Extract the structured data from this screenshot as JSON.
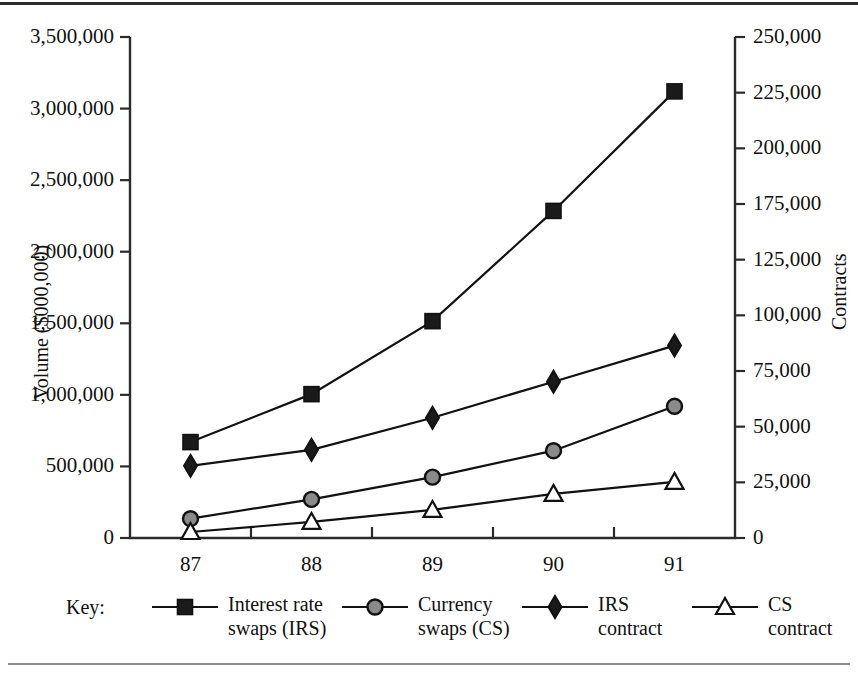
{
  "chart_data": {
    "type": "line",
    "title": "",
    "subtitle": "",
    "xlabel": "",
    "ylabel": "Volume ($000,000)",
    "y2label": "Contracts",
    "x": [
      "87",
      "88",
      "89",
      "90",
      "91"
    ],
    "categories": [
      "87",
      "88",
      "89",
      "90",
      "91"
    ],
    "ylim": [
      0,
      3500000
    ],
    "y2lim": [
      0,
      250000
    ],
    "grid": false,
    "legend_position": "bottom",
    "legend_title": "Key:",
    "y_ticks": [
      "0",
      "500,000",
      "1,000,000",
      "1,500,000",
      "2,000,000",
      "2,500,000",
      "3,000,000",
      "3,500,000"
    ],
    "y_tick_values": [
      0,
      500000,
      1000000,
      1500000,
      2000000,
      2500000,
      3000000,
      3500000
    ],
    "y2_ticks": [
      "0",
      "25,000",
      "50,000",
      "75,000",
      "100,000",
      "125,000",
      "175,000",
      "200,000",
      "225,000",
      "250,000"
    ],
    "y2_tick_values": [
      0,
      25000,
      50000,
      75000,
      100000,
      125000,
      150000,
      175000,
      200000,
      225000,
      250000
    ],
    "series": [
      {
        "name": "Interest rate swaps (IRS)",
        "label_line1": "Interest rate",
        "label_line2": "swaps (IRS)",
        "marker": "filled-square",
        "axis": "left",
        "values": [
          670000,
          1005000,
          1515000,
          2285000,
          3120000
        ]
      },
      {
        "name": "Currency swaps (CS)",
        "label_line1": "Currency",
        "label_line2": "swaps (CS)",
        "marker": "open-circle",
        "axis": "left",
        "values": [
          135000,
          270000,
          425000,
          610000,
          920000
        ]
      },
      {
        "name": "IRS contract",
        "label_line1": "IRS",
        "label_line2": "contract",
        "marker": "open-diamond",
        "axis": "right",
        "values": [
          36000,
          44000,
          60000,
          78000,
          96000
        ]
      },
      {
        "name": "CS contract",
        "label_line1": "CS",
        "label_line2": "contract",
        "marker": "open-triangle",
        "axis": "right",
        "values": [
          3000,
          8000,
          14000,
          22000,
          28000
        ]
      }
    ],
    "colors": {
      "line": "#111111",
      "marker_fill_dark": "#1a1a1a",
      "marker_fill_light": "#ffffff",
      "marker_fill_grey": "#8a8a8a",
      "axis": "#2b2b2b",
      "background": "#ffffff"
    }
  },
  "axes": {
    "left_title": "Volume ($000,000)",
    "right_title": "Contracts"
  },
  "legend": {
    "key_label": "Key:"
  }
}
